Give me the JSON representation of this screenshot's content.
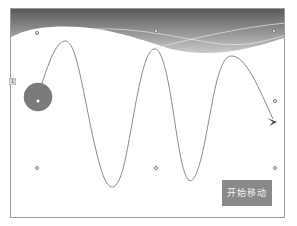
{
  "slide": {
    "header_gradient": {
      "dark": "#5f5f5f",
      "light": "#c8c8c8"
    },
    "motion_path": {
      "stroke": "#8a8a8a",
      "start_marker": "green-circle",
      "end_marker": "red-arrow"
    },
    "animated_object": {
      "shape": "circle",
      "fill": "#7a7a7a"
    },
    "animation_tag": {
      "label": "1",
      "icon": "animation-order-tag"
    }
  },
  "button": {
    "label": "开始移动",
    "color": "#8a8a8a"
  }
}
